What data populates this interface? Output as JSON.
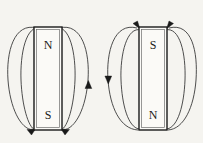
{
  "figure": {
    "background_color": "#f5f4f0",
    "line_color": "#3a3a3a",
    "magnet_fill": "#fbfaf7",
    "magnet_stroke": "#1a1a1a",
    "label_color": "#1a1a1a"
  },
  "magnets": [
    {
      "id": "left-magnet",
      "orientation": "north-up",
      "top_label": "N",
      "bottom_label": "S",
      "x": 34,
      "y": 27,
      "width": 28,
      "height": 103,
      "field_arrow_direction": "upward-on-right-side",
      "field_arrows": [
        {
          "name": "right-side-up-arrow",
          "x": 85,
          "y": 86,
          "direction": "up"
        },
        {
          "name": "bottom-left-in-arrow",
          "x": 33,
          "y": 131,
          "direction": "up-right"
        },
        {
          "name": "bottom-right-in-arrow",
          "x": 63,
          "y": 131,
          "direction": "up-left"
        }
      ]
    },
    {
      "id": "right-magnet",
      "orientation": "south-up",
      "top_label": "S",
      "bottom_label": "N",
      "x": 139,
      "y": 27,
      "width": 28,
      "height": 103,
      "field_arrow_direction": "downward-on-left-side",
      "field_arrows": [
        {
          "name": "left-side-down-arrow",
          "x": 114,
          "y": 79,
          "direction": "down"
        },
        {
          "name": "top-left-in-arrow",
          "x": 138,
          "y": 26,
          "direction": "down-right"
        },
        {
          "name": "top-right-in-arrow",
          "x": 168,
          "y": 26,
          "direction": "down-left"
        }
      ]
    }
  ]
}
